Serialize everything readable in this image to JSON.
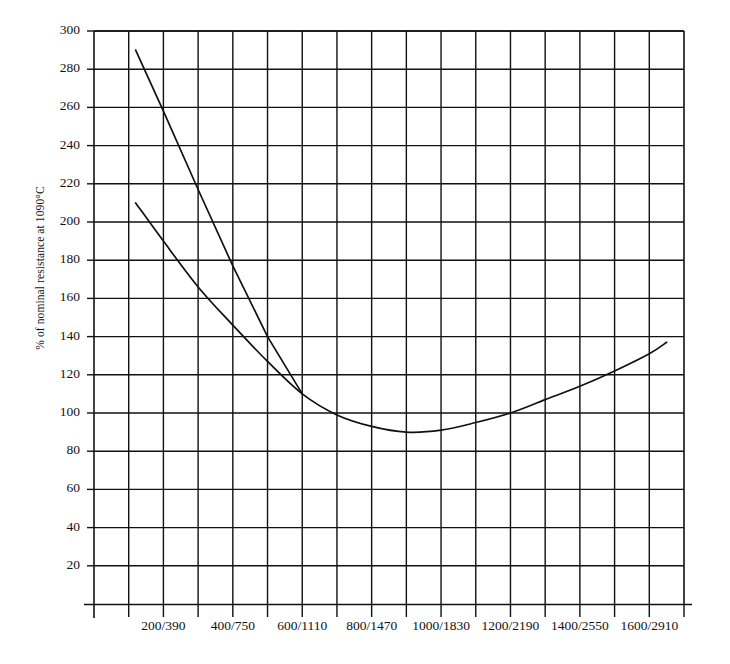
{
  "chart_data": {
    "type": "line",
    "title": "",
    "subtitle": "",
    "xlabel": "",
    "ylabel": "% of nominal resistance at 1090°C",
    "xlim": [
      0,
      1700
    ],
    "ylim": [
      0,
      300
    ],
    "grid": true,
    "legend_position": "none",
    "x_tick_labels": [
      "200/390",
      "400/750",
      "600/1110",
      "800/1470",
      "1000/1830",
      "1200/2190",
      "1400/2550",
      "1600/2910"
    ],
    "x_tick_values": [
      200,
      400,
      600,
      800,
      1000,
      1200,
      1400,
      1600
    ],
    "y_tick_labels": [
      "20",
      "40",
      "60",
      "80",
      "100",
      "120",
      "140",
      "160",
      "180",
      "200",
      "220",
      "240",
      "260",
      "280",
      "300"
    ],
    "y_tick_values": [
      20,
      40,
      60,
      80,
      100,
      120,
      140,
      160,
      180,
      200,
      220,
      240,
      260,
      280,
      300
    ],
    "series": [
      {
        "name": "steep-characteristic",
        "style": "straight-line",
        "x": [
          120,
          200,
          300,
          400,
          500,
          600
        ],
        "values": [
          290,
          258,
          217,
          177,
          140,
          110
        ]
      },
      {
        "name": "shallow-characteristic",
        "style": "curve",
        "x": [
          120,
          200,
          300,
          400,
          500,
          600,
          700,
          800,
          900,
          1000,
          1100,
          1200,
          1300,
          1400,
          1500,
          1600,
          1650
        ],
        "values": [
          210,
          190,
          166,
          146,
          127,
          110,
          99,
          93,
          90,
          91,
          95,
          100,
          107,
          114,
          122,
          131,
          137
        ]
      }
    ],
    "annotations": []
  },
  "axes": {
    "line_color": "#111111",
    "grid_color": "#111111",
    "series_color": "#111111",
    "background": "#ffffff"
  }
}
